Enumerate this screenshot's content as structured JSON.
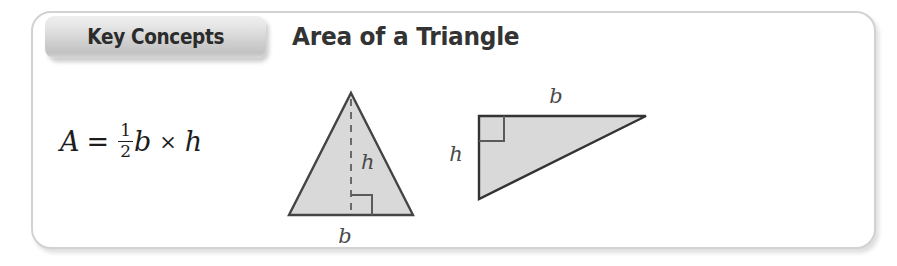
{
  "callout": {
    "tab_label": "Key Concepts",
    "title": "Area of a Triangle",
    "border_color": "#d2d2d2",
    "background_color": "#ffffff"
  },
  "formula": {
    "left_side": "A",
    "equals": "=",
    "fraction_numerator": "1",
    "fraction_denominator": "2",
    "base_variable": "b",
    "multiply_symbol": "×",
    "height_variable": "h",
    "plain_text": "A = 1/2 b × h"
  },
  "diagrams": [
    {
      "name": "isosceles-triangle",
      "shape": "isosceles triangle",
      "fill_color": "#d9d9d9",
      "stroke_color": "#444444",
      "height_label": "h",
      "base_label": "b",
      "height_line_style": "dashed",
      "right_angle_marker": true
    },
    {
      "name": "right-triangle",
      "shape": "right triangle",
      "fill_color": "#d9d9d9",
      "stroke_color": "#333333",
      "height_label": "h",
      "base_label": "b",
      "right_angle_marker": true,
      "right_angle_position": "top-left"
    }
  ]
}
